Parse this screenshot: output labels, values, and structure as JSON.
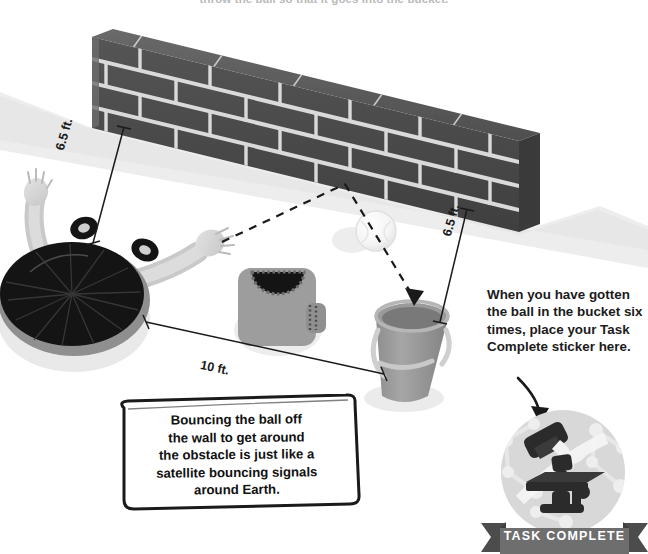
{
  "page": {
    "background_color": "#ffffff",
    "top_caption": "throw the ball so that it goes into the bucket."
  },
  "scene": {
    "wall": {
      "name": "brick-wall",
      "brick_color": "#4a4a4a",
      "mortar_color": "#d9d9d9",
      "shadow_color": "#e8e8e8",
      "rows": 4,
      "description": "angled dark grey brick wall running across the top of the scene"
    },
    "thrower": {
      "name": "person-throwing",
      "hair_color": "#111111",
      "skin_color": "#d6d6d6",
      "shirt_color": "#9a9a9a"
    },
    "obstacle": {
      "name": "person-obstacle",
      "shirt_color": "#9d9d9d",
      "hair_color": "#111111"
    },
    "bucket": {
      "name": "bucket",
      "body_color": "#9c9c9c",
      "rim_color": "#b5b5b5",
      "handle_color": "#cfcfcf"
    },
    "ball": {
      "name": "ball",
      "color": "#fbfbfb",
      "outline_color": "#dddddd"
    },
    "trajectory": {
      "name": "ball-trajectory",
      "style": "dashed",
      "color": "#1a1a1a",
      "bounce_point_label": "wall bounce point",
      "arrow_target": "bucket"
    }
  },
  "dimensions": [
    {
      "id": "dim-left",
      "value": "6.5 ft.",
      "from": "thrower",
      "to": "wall"
    },
    {
      "id": "dim-right",
      "value": "6.5 ft.",
      "from": "bucket",
      "to": "wall"
    },
    {
      "id": "dim-bottom",
      "value": "10 ft.",
      "from": "thrower",
      "to": "bucket"
    }
  ],
  "fact_box": {
    "name": "science-fact-callout",
    "lines": [
      "Bouncing the ball off",
      "the wall to get around",
      "the obstacle is just like a",
      "satellite bouncing signals",
      "around Earth."
    ],
    "border_color": "#1a1a1a",
    "fill_color": "#ffffff"
  },
  "instruction": {
    "name": "sticker-instruction",
    "lines": [
      "When you have gotten",
      "the ball in the bucket six",
      "times, place your Task",
      "Complete sticker here."
    ],
    "arrow": "curved-arrow-pointing-to-sticker"
  },
  "sticker": {
    "name": "task-complete-sticker",
    "icon": "microscope-icon",
    "circle_fill": "#d8d8d8",
    "pattern": "molecule-pattern",
    "microscope_color": "#2b2b2b"
  },
  "banner": {
    "name": "task-complete-banner",
    "label": "TASK COMPLETE",
    "ribbon_color": "#6e6e6e",
    "ribbon_shadow": "#4c4c4c",
    "text_color": "#ffffff"
  }
}
